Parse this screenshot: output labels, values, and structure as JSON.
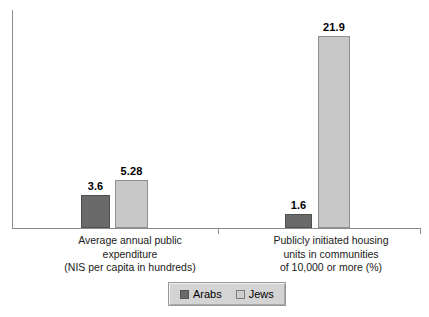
{
  "chart_data": {
    "type": "bar",
    "title": "",
    "xlabel": "",
    "ylabel": "",
    "grid": false,
    "legend_position": "bottom",
    "categories": [
      "Average annual public expenditure (NIS per capita in hundreds)",
      "Publicly initiated housing units in communities of 10,000 or more (%)"
    ],
    "category_lines": [
      [
        "Average annual public",
        "expenditure",
        "(NIS per capita in hundreds)"
      ],
      [
        "Publicly initiated housing",
        "units in communities",
        "of 10,000 or more (%)"
      ]
    ],
    "series": [
      {
        "name": "Arabs",
        "color": "#6a6a6a",
        "values": [
          3.6,
          1.6
        ],
        "labels": [
          "3.6",
          "1.6"
        ]
      },
      {
        "name": "Jews",
        "color": "#c8c8c8",
        "values": [
          5.28,
          21.9
        ],
        "labels": [
          "5.28",
          "21.9"
        ]
      }
    ],
    "group_scales_px_per_unit": [
      9.1,
      8.77
    ],
    "baseline_y": 228,
    "plot_top_y": 10
  },
  "legend": {
    "items": [
      {
        "label": "Arabs",
        "swatch": "dark-gray-swatch"
      },
      {
        "label": "Jews",
        "swatch": "light-gray-swatch"
      }
    ]
  },
  "colors": {
    "arabs": "#6a6a6a",
    "jews": "#c8c8c8",
    "axis": "#8c8c8c",
    "legend_background": "#d4d4d4",
    "text": "#000000"
  }
}
